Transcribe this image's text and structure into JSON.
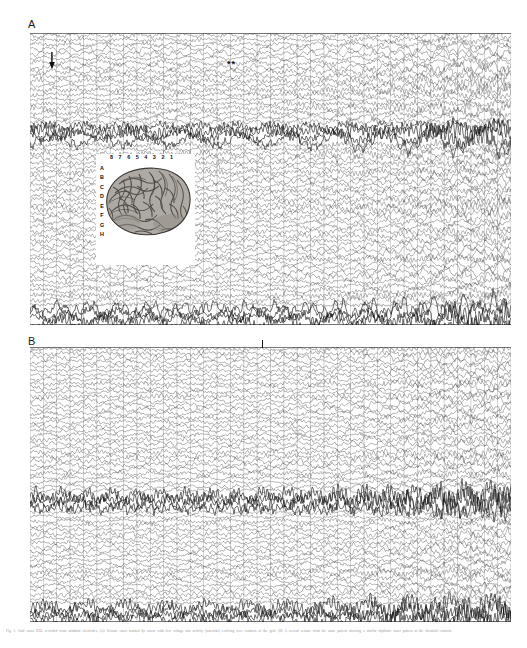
{
  "figure": {
    "background_color": "#ffffff",
    "width": 527,
    "height": 648,
    "caption": "Fig. 2. Ictal onset EEG recorded from subdural electrodes. (A) Seizure onset marked by arrow with low voltage fast activity (asterisks) evolving over contacts of the grid. (B) A second seizure from the same patient showing a similar rhythmic onset pattern at the identical contacts.",
    "panels": [
      {
        "id": "A",
        "label": "A",
        "label_x": 28,
        "label_y": 19,
        "x": 30,
        "y": 33,
        "width": 481,
        "height": 292,
        "n_traces": 64,
        "n_gridlines": 36,
        "dark_band_rows": [
          20,
          21,
          22,
          23,
          60,
          61,
          62,
          63
        ],
        "markers": [
          {
            "type": "arrow-down",
            "name": "seizure-onset-arrow",
            "x": 51,
            "y": 52,
            "height": 16
          },
          {
            "type": "asterisk-pair",
            "name": "fast-activity-asterisks",
            "label": "**",
            "x": 228,
            "y": 63
          }
        ]
      },
      {
        "id": "B",
        "label": "B",
        "label_x": 28,
        "label_y": 336,
        "x": 30,
        "y": 347,
        "width": 481,
        "height": 275,
        "n_traces": 64,
        "n_gridlines": 36,
        "dark_band_rows": [
          34,
          35,
          36,
          37,
          60,
          61,
          62,
          63
        ],
        "markers": [
          {
            "type": "tick",
            "name": "onset-tick-marker",
            "x": 262,
            "y": 341,
            "height": 7
          }
        ]
      }
    ],
    "inset": {
      "name": "brain-electrode-grid-inset",
      "x": 96,
      "y": 154,
      "width": 99,
      "height": 111,
      "column_labels": [
        "8",
        "7",
        "6",
        "5",
        "4",
        "3",
        "2",
        "1"
      ],
      "row_labels": [
        "A",
        "B",
        "C",
        "D",
        "E",
        "F",
        "G",
        "H"
      ],
      "description": "Lateral view of cerebral hemisphere with 8x8 subdural electrode grid"
    }
  }
}
